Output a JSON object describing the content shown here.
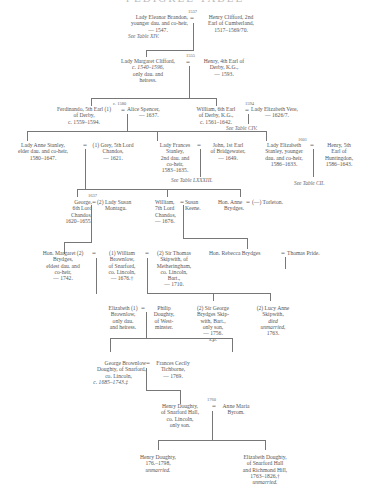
{
  "title": "PEDIGREE TABLE",
  "generation1": {
    "marriage_year": "1537",
    "wife": {
      "lines": [
        "Lady Eleanor Brandon,",
        "younger dau. and co-heir,",
        "— 1547."
      ],
      "see": "See Table XIV."
    },
    "husband": {
      "lines": [
        "Henry Clifford, 2nd",
        "Earl of Cumberland,",
        "1517–1569/70."
      ]
    }
  },
  "generation2": {
    "marriage_year": "1555",
    "wife": {
      "lines": [
        "Lady Margaret Clifford,",
        "c. 1540–1596,",
        "only dau. and",
        "heiress."
      ]
    },
    "husband": {
      "lines": [
        "Henry, 4th Earl of",
        "Derby, K.G.,",
        "— 1593."
      ]
    }
  },
  "generation3": [
    {
      "marriage_year": "c. 1580",
      "husband": {
        "lines": [
          "Ferdinando, 5th Earl (1)",
          "of Derby,",
          "c. 1559–1594."
        ]
      },
      "wife": {
        "lines": [
          "Alice Spencer,",
          "— 1637."
        ]
      }
    },
    {
      "marriage_year": "1594",
      "husband": {
        "lines": [
          "William, 6th Earl",
          "of Derby, K.G.,",
          "c. 1561–1642."
        ]
      },
      "wife": {
        "lines": [
          "Lady Elizabeth Vere,",
          "— 1626/7."
        ]
      },
      "see": "See Table CIV."
    }
  ],
  "generation4": [
    {
      "wife": {
        "lines": [
          "Lady Anne Stanley,",
          "elder dau. and co-heir,",
          "1580–1647."
        ]
      },
      "husband": {
        "lines": [
          "(1) Grey, 5th Lord",
          "Chandos,",
          "— 1621."
        ]
      }
    },
    {
      "wife": {
        "lines": [
          "Lady Frances",
          "Stanley,",
          "2nd dau. and",
          "co-heir,",
          "1583–1635."
        ]
      },
      "husband": {
        "lines": [
          "John, 1st Earl",
          "of Bridgewater,",
          "— 1649."
        ]
      },
      "see": "See Table LXXXIII."
    },
    {
      "marriage_year": "1601",
      "wife": {
        "lines": [
          "Lady Elizabeth",
          "Stanley, younger",
          "dau. and co-heir,",
          "1586–1633."
        ]
      },
      "husband": {
        "lines": [
          "Henry, 5th",
          "Earl of",
          "Huntingdon,",
          "1586–1643."
        ]
      },
      "see": "See Table CII."
    }
  ],
  "generation5": [
    {
      "marriage_year": "1637",
      "husband": {
        "lines": [
          "George,",
          "6th Lord",
          "Chandos,",
          "1620–1655."
        ]
      },
      "wife": {
        "lines": [
          "(2) Lady Susan",
          "Montagu."
        ]
      }
    },
    {
      "husband": {
        "lines": [
          "William,",
          "7th Lord",
          "Chandos,",
          "— 1676."
        ]
      },
      "wife": {
        "lines": [
          "Susan",
          "Keene."
        ]
      }
    },
    {
      "wife": {
        "lines": [
          "Hon. Anne",
          "Brydges."
        ]
      },
      "husband": {
        "lines": [
          "(—) Torleton."
        ]
      }
    }
  ],
  "generation6": {
    "margaret": {
      "lines": [
        "Hon. Margaret (2)",
        "Brydges,",
        "eldest dau. and",
        "co-heir,",
        "— 1742."
      ]
    },
    "husband1": {
      "lines": [
        "(1) William",
        "Brownlow,",
        "of Snarford,",
        "co. Lincoln,",
        "— 1676.†"
      ]
    },
    "husband2": {
      "lines": [
        "(2) Sir Thomas",
        "Skipwith, of",
        "Metheringham,",
        "co. Lincoln,",
        "Bart.,",
        "— 1710."
      ]
    },
    "rebecca": {
      "lines": [
        "Hon. Rebecca Brydges"
      ]
    },
    "rebecca_husband": {
      "lines": [
        "Thomas Pride."
      ]
    }
  },
  "generation7": [
    {
      "wife": {
        "lines": [
          "Elizabeth (1)",
          "Brownlow,",
          "only dau.",
          "and heiress."
        ]
      },
      "husband": {
        "lines": [
          "Philip",
          "Doughty,",
          "of West-",
          "minster."
        ]
      }
    },
    {
      "person": {
        "lines": [
          "(2) Sir George",
          "Brydges Skip-",
          "with, Bart.,",
          "only son,",
          "— 1756."
        ],
        "note": "s.p."
      }
    },
    {
      "person": {
        "lines": [
          "(2) Lucy Anne",
          "Skipwith,"
        ],
        "italic_lines": [
          "died",
          "unmarried,"
        ],
        "year": "1763."
      }
    }
  ],
  "generation8": {
    "husband": {
      "lines": [
        "George Brownlow",
        "Doughty, of Snarford,",
        "co. Lincoln,",
        "c. 1685–1743.‡"
      ]
    },
    "wife": {
      "lines": [
        "Frances Cecily",
        "Tichborne,",
        "— 1769."
      ]
    }
  },
  "generation9": {
    "marriage_year": "1760",
    "husband": {
      "lines": [
        "Henry Doughty,",
        "of Snarford Hall,",
        "co. Lincoln,",
        "only son."
      ]
    },
    "wife": {
      "lines": [
        "Anne Maria",
        "Byrom."
      ]
    }
  },
  "generation10": [
    {
      "lines": [
        "Henry Doughty,",
        "176.–1798,"
      ],
      "italic": "unmarried."
    },
    {
      "lines": [
        "Elizabeth Doughty,",
        "of Snarford Hall",
        "and Richmond Hill,",
        "1763–1826,†"
      ],
      "italic": "unmarried."
    }
  ],
  "symbols": {
    "eq": "=",
    "eq_cross": "⸗"
  }
}
